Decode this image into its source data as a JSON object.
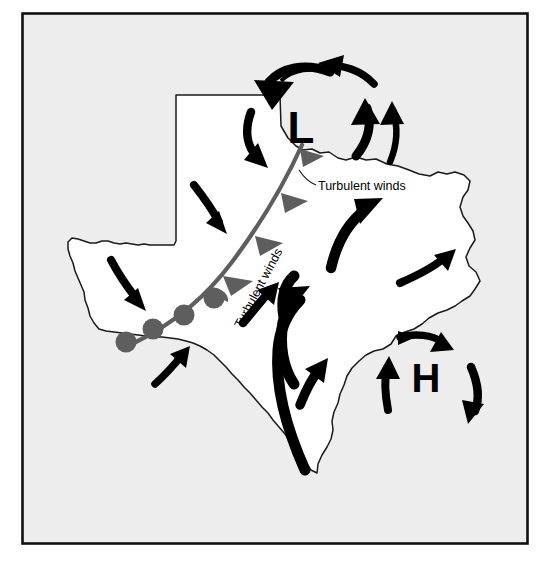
{
  "figure": {
    "kind": "weather-map-diagram",
    "region_name": "Texas",
    "background_color": "#ededed",
    "map_fill_color": "#ffffff",
    "map_stroke_color": "#1a1a1a",
    "border_color": "#111111",
    "arrow_color": "#000000",
    "front_color": "#5e5e5e"
  },
  "pressure_centers": [
    {
      "id": "low",
      "symbol": "L",
      "name": "low-pressure-center",
      "x": 301,
      "y": 131,
      "font_size": 44,
      "circulation": "counterclockwise",
      "circulation_label": "cyclonic"
    },
    {
      "id": "high",
      "symbol": "H",
      "name": "high-pressure-center",
      "x": 426,
      "y": 381,
      "font_size": 40,
      "circulation": "clockwise",
      "circulation_label": "anticyclonic"
    }
  ],
  "annotations": [
    {
      "id": "turb-horizontal",
      "text": "Turbulent winds",
      "x": 318,
      "y": 190,
      "rotation": 0,
      "font_size": 12.5
    },
    {
      "id": "turb-rotated",
      "text": "Turbulent winds",
      "x": 262,
      "y": 290,
      "rotation": -62,
      "font_size": 12.5
    }
  ],
  "front": {
    "type": "occluded-front",
    "label": "occluded front line",
    "color": "#5e5e5e",
    "cold_symbol": "triangle",
    "warm_symbol": "semicircle",
    "triangle_count": 4,
    "semicircle_count": 4
  },
  "legend_notes": {
    "low_meaning": "Low pressure",
    "high_meaning": "High pressure"
  }
}
